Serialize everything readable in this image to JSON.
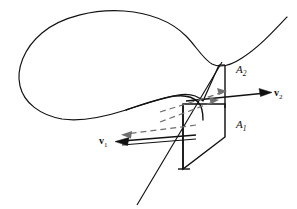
{
  "figure": {
    "title": "",
    "background_color": "#ffffff",
    "stroke_color": "#111111",
    "dashed_color": "#6f6f6f",
    "width": 297,
    "height": 209,
    "labels": {
      "area_1": "A",
      "area_1_sub": "1",
      "area_2": "A",
      "area_2_sub": "2",
      "velocity_1": "v",
      "velocity_1_sub": "1",
      "velocity_2": "v",
      "velocity_2_sub": "2"
    },
    "elements": {
      "outer_tube_curve": "stream-tube-outline",
      "lower_cross_section": "area-A1-parallelogram",
      "upper_cross_section": "area-A2-parallelogram",
      "velocity_arrow_left": "v1-arrow",
      "velocity_arrow_right": "v2-arrow",
      "dashed_guide_left": "dashed-projection-left",
      "dashed_guide_right": "dashed-projection-right",
      "axis_line": "diagonal-axis-line"
    }
  }
}
